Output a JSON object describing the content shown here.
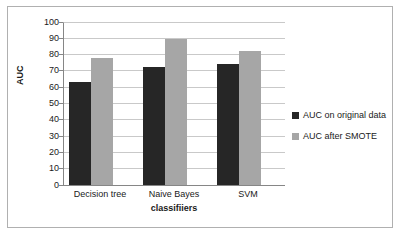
{
  "chart_data": {
    "type": "bar",
    "title": "",
    "xlabel": "classifiiers",
    "ylabel": "AUC",
    "categories": [
      "Decision tree",
      "Naive Bayes",
      "SVM"
    ],
    "series": [
      {
        "name": "AUC on original data",
        "color": "#262626",
        "values": [
          63,
          72.5,
          74.5
        ]
      },
      {
        "name": "AUC after SMOTE",
        "color": "#a6a6a6",
        "values": [
          78,
          89.5,
          82
        ]
      }
    ],
    "ylim": [
      0,
      100
    ],
    "ytick_labels": [
      "100",
      "90",
      "80",
      "70",
      "60",
      "50",
      "40",
      "30",
      "20",
      "10",
      "0"
    ],
    "ytick_values": [
      100,
      90,
      80,
      70,
      60,
      50,
      40,
      30,
      20,
      10,
      0
    ],
    "grid": true,
    "legend_position": "right"
  }
}
